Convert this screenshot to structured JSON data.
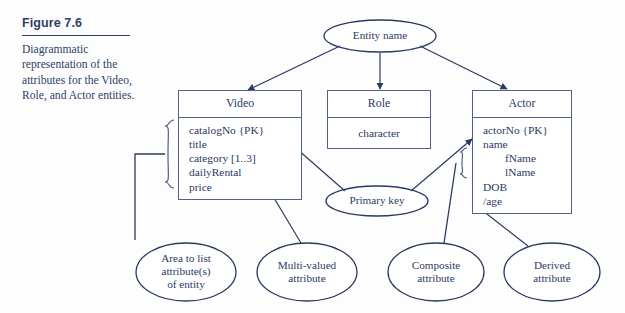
{
  "figure": {
    "number": "Figure 7.6",
    "description": "Diagrammatic representation of the attributes for the Video, Role, and Actor entities."
  },
  "colors": {
    "ink": "#2b3a62",
    "line": "#51618c",
    "background": "#fdfdfd"
  },
  "callouts": {
    "entity_name": "Entity name",
    "primary_key": "Primary key",
    "area_to_list": "Area to list attribute(s) of entity",
    "area_to_list_lines": [
      "Area to list",
      "attribute(s)",
      "of entity"
    ],
    "multi_valued": "Multi-valued attribute",
    "multi_valued_lines": [
      "Multi-valued",
      "attribute"
    ],
    "composite": "Composite attribute",
    "composite_lines": [
      "Composite",
      "attribute"
    ],
    "derived": "Derived attribute",
    "derived_lines": [
      "Derived",
      "attribute"
    ]
  },
  "entities": [
    {
      "name": "Video",
      "attributes": [
        {
          "text": "catalogNo {PK}",
          "indent": false
        },
        {
          "text": "title",
          "indent": false
        },
        {
          "text": "category [1..3]",
          "indent": false
        },
        {
          "text": "dailyRental",
          "indent": false
        },
        {
          "text": "price",
          "indent": false
        }
      ]
    },
    {
      "name": "Role",
      "attributes": [
        {
          "text": "character",
          "indent": false
        }
      ]
    },
    {
      "name": "Actor",
      "attributes": [
        {
          "text": "actorNo {PK}",
          "indent": false
        },
        {
          "text": "name",
          "indent": false
        },
        {
          "text": "fName",
          "indent": true
        },
        {
          "text": "lName",
          "indent": true
        },
        {
          "text": "DOB",
          "indent": false
        },
        {
          "text": "/age",
          "indent": false
        }
      ]
    }
  ]
}
